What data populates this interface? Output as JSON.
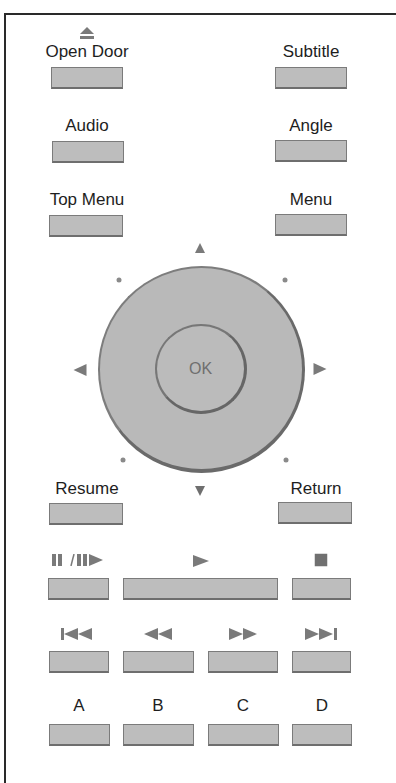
{
  "remote": {
    "colors": {
      "button_fill": "#bdbdbd",
      "button_border": "#7b7b7b",
      "icon": "#7a7a7a",
      "frame": "#2a2a2a"
    },
    "top_buttons": {
      "open_door": {
        "label": "Open Door",
        "icon": "eject-icon"
      },
      "subtitle": {
        "label": "Subtitle"
      },
      "audio": {
        "label": "Audio"
      },
      "angle": {
        "label": "Angle"
      },
      "top_menu": {
        "label": "Top Menu"
      },
      "menu": {
        "label": "Menu"
      }
    },
    "dpad": {
      "ok_label": "OK",
      "arrows": [
        "up-arrow-icon",
        "down-arrow-icon",
        "left-arrow-icon",
        "right-arrow-icon"
      ]
    },
    "nav_buttons": {
      "resume": {
        "label": "Resume"
      },
      "return": {
        "label": "Return"
      }
    },
    "playback_row": [
      {
        "name": "pause-step",
        "icon": "pause-step-icon"
      },
      {
        "name": "play",
        "icon": "play-icon"
      },
      {
        "name": "stop",
        "icon": "stop-icon"
      }
    ],
    "skip_row": [
      {
        "name": "skip-previous",
        "icon": "skip-previous-icon"
      },
      {
        "name": "rewind",
        "icon": "rewind-icon"
      },
      {
        "name": "fast-forward",
        "icon": "fast-forward-icon"
      },
      {
        "name": "skip-next",
        "icon": "skip-next-icon"
      }
    ],
    "color_row": [
      {
        "label": "A"
      },
      {
        "label": "B"
      },
      {
        "label": "C"
      },
      {
        "label": "D"
      }
    ]
  }
}
